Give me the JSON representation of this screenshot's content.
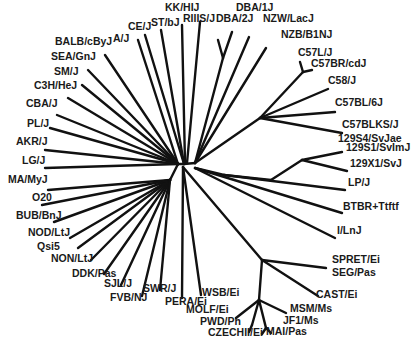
{
  "diagram": {
    "type": "unrooted phylogenetic tree",
    "line_color": "#111111",
    "label_color": "#1a1a1a",
    "background": "#ffffff"
  },
  "labels": [
    {
      "text": "KK/HIJ",
      "x": 165,
      "y": 11
    },
    {
      "text": "DBA/1J",
      "x": 236,
      "y": 11
    },
    {
      "text": "CE/J",
      "x": 128,
      "y": 30
    },
    {
      "text": "ST/bJ",
      "x": 151,
      "y": 26
    },
    {
      "text": "RIIIS/J",
      "x": 183,
      "y": 22
    },
    {
      "text": "DBA/2J",
      "x": 216,
      "y": 22
    },
    {
      "text": "NZW/LacJ",
      "x": 263,
      "y": 22
    },
    {
      "text": "A/J",
      "x": 113,
      "y": 42
    },
    {
      "text": "BALB/cByJ",
      "x": 55,
      "y": 45
    },
    {
      "text": "NZB/B1NJ",
      "x": 281,
      "y": 38
    },
    {
      "text": "SEA/GnJ",
      "x": 51,
      "y": 60
    },
    {
      "text": "C57L/J",
      "x": 298,
      "y": 56
    },
    {
      "text": "C57BR/cdJ",
      "x": 311,
      "y": 67
    },
    {
      "text": "SM/J",
      "x": 54,
      "y": 75
    },
    {
      "text": "C3H/HeJ",
      "x": 34,
      "y": 89
    },
    {
      "text": "C58/J",
      "x": 328,
      "y": 84
    },
    {
      "text": "CBA/J",
      "x": 26,
      "y": 107
    },
    {
      "text": "C57BL/6J",
      "x": 335,
      "y": 106
    },
    {
      "text": "PL/J",
      "x": 27,
      "y": 127
    },
    {
      "text": "C57BLKS/J",
      "x": 342,
      "y": 128
    },
    {
      "text": "129S4/SvJae",
      "x": 338,
      "y": 142
    },
    {
      "text": "129S1/SvImJ",
      "x": 346,
      "y": 151
    },
    {
      "text": "AKR/J",
      "x": 16,
      "y": 145
    },
    {
      "text": "129X1/SvJ",
      "x": 350,
      "y": 167
    },
    {
      "text": "LG/J",
      "x": 22,
      "y": 164
    },
    {
      "text": "MA/MyJ",
      "x": 8,
      "y": 183
    },
    {
      "text": "LP/J",
      "x": 348,
      "y": 186
    },
    {
      "text": "O20",
      "x": 32,
      "y": 201
    },
    {
      "text": "BTBR+Ttftf",
      "x": 343,
      "y": 210
    },
    {
      "text": "BUB/BnJ",
      "x": 16,
      "y": 219
    },
    {
      "text": "NOD/LtJ",
      "x": 28,
      "y": 236
    },
    {
      "text": "I/LnJ",
      "x": 337,
      "y": 234
    },
    {
      "text": "Qsi5",
      "x": 37,
      "y": 250
    },
    {
      "text": "NON/LtJ",
      "x": 51,
      "y": 262
    },
    {
      "text": "SPRET/Ei",
      "x": 332,
      "y": 263
    },
    {
      "text": "DDK/Pas",
      "x": 72,
      "y": 277
    },
    {
      "text": "SEG/Pas",
      "x": 332,
      "y": 276
    },
    {
      "text": "SJL/J",
      "x": 104,
      "y": 287
    },
    {
      "text": "CAST/Ei",
      "x": 316,
      "y": 298
    },
    {
      "text": "FVB/NJ",
      "x": 110,
      "y": 301
    },
    {
      "text": "SWR/J",
      "x": 143,
      "y": 292
    },
    {
      "text": "WSB/Ei",
      "x": 202,
      "y": 296
    },
    {
      "text": "PERA/Ei",
      "x": 165,
      "y": 305
    },
    {
      "text": "MSM/Ms",
      "x": 290,
      "y": 312
    },
    {
      "text": "MOLF/Ei",
      "x": 186,
      "y": 313
    },
    {
      "text": "JF1/Ms",
      "x": 283,
      "y": 324
    },
    {
      "text": "PWD/Ph",
      "x": 200,
      "y": 325
    },
    {
      "text": "MAI/Pas",
      "x": 266,
      "y": 335
    },
    {
      "text": "CZECHII/Ei",
      "x": 208,
      "y": 336
    }
  ],
  "branches": [
    [
      178,
      164,
      184,
      164
    ],
    [
      184,
      164,
      195,
      163
    ],
    [
      178,
      164,
      12,
      0
    ],
    [
      184,
      164,
      145,
      35
    ],
    [
      184,
      164,
      161,
      30
    ],
    [
      185,
      163,
      182,
      25
    ],
    [
      187,
      163,
      200,
      22
    ],
    [
      178,
      164,
      138,
      40
    ],
    [
      178,
      164,
      105,
      55
    ],
    [
      178,
      164,
      88,
      70
    ],
    [
      178,
      164,
      82,
      85
    ],
    [
      178,
      164,
      68,
      98
    ],
    [
      178,
      164,
      57,
      115
    ],
    [
      178,
      164,
      50,
      128
    ],
    [
      178,
      164,
      45,
      150
    ],
    [
      178,
      164,
      45,
      168
    ],
    [
      195,
      163,
      223,
      58
    ],
    [
      223,
      58,
      218,
      40
    ],
    [
      223,
      58,
      232,
      32
    ],
    [
      195,
      163,
      249,
      37
    ],
    [
      195,
      163,
      266,
      48
    ],
    [
      195,
      163,
      260,
      118
    ],
    [
      260,
      118,
      303,
      72
    ],
    [
      303,
      72,
      300,
      62
    ],
    [
      303,
      72,
      312,
      70
    ],
    [
      260,
      118,
      328,
      89
    ],
    [
      260,
      118,
      335,
      112
    ],
    [
      260,
      118,
      342,
      133
    ],
    [
      195,
      168,
      224,
      175
    ],
    [
      224,
      175,
      271,
      180
    ],
    [
      271,
      180,
      302,
      160
    ],
    [
      302,
      160,
      342,
      152
    ],
    [
      302,
      160,
      347,
      171
    ],
    [
      224,
      175,
      345,
      190
    ],
    [
      195,
      168,
      342,
      213
    ],
    [
      195,
      168,
      335,
      238
    ],
    [
      183,
      167,
      262,
      260
    ],
    [
      262,
      260,
      326,
      268
    ],
    [
      262,
      260,
      318,
      296
    ],
    [
      262,
      260,
      259,
      300
    ],
    [
      259,
      300,
      236,
      318
    ],
    [
      259,
      300,
      252,
      325
    ],
    [
      252,
      325,
      249,
      332
    ],
    [
      259,
      300,
      266,
      328
    ],
    [
      266,
      328,
      262,
      334
    ],
    [
      266,
      328,
      271,
      333
    ],
    [
      259,
      300,
      286,
      313
    ],
    [
      170,
      180,
      48,
      190
    ],
    [
      170,
      180,
      42,
      205
    ],
    [
      170,
      180,
      54,
      222
    ],
    [
      170,
      180,
      70,
      238
    ],
    [
      170,
      180,
      78,
      248
    ],
    [
      170,
      180,
      91,
      260
    ],
    [
      170,
      180,
      104,
      274
    ],
    [
      170,
      180,
      121,
      285
    ],
    [
      170,
      180,
      142,
      296
    ],
    [
      170,
      180,
      160,
      290
    ],
    [
      178,
      164,
      170,
      180
    ],
    [
      183,
      167,
      182,
      298
    ],
    [
      183,
      167,
      201,
      295
    ]
  ]
}
